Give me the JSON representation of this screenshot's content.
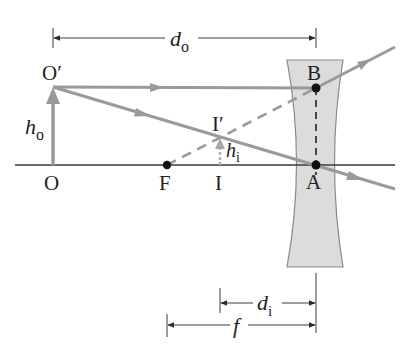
{
  "diagram": {
    "type": "ray-diagram-diverging-lens",
    "colors": {
      "ray": "#9a9a9a",
      "axis": "#3a3a3a",
      "lens_fill": "#dcdcdc",
      "lens_stroke": "#8a8a8a",
      "point": "#111111",
      "dimension": "#3a3a3a",
      "text": "#231f20"
    },
    "points": {
      "object_base": {
        "label": "O",
        "x": 53,
        "y": 165
      },
      "object_tip": {
        "label": "O′",
        "x": 53,
        "y": 87
      },
      "focal_point": {
        "label": "F",
        "x": 167,
        "y": 165
      },
      "image_base": {
        "label": "I",
        "x": 220,
        "y": 165
      },
      "image_tip": {
        "label": "I′",
        "x": 220,
        "y": 138
      },
      "lens_top_point": {
        "label": "B",
        "x": 316,
        "y": 88
      },
      "lens_center": {
        "label": "A",
        "x": 316,
        "y": 165
      }
    },
    "dimensions": {
      "object_distance": {
        "label_main": "d",
        "label_sub": "o"
      },
      "image_distance": {
        "label_main": "d",
        "label_sub": "i"
      },
      "focal_length": {
        "label_main": "f"
      },
      "object_height": {
        "label_main": "h",
        "label_sub": "o"
      },
      "image_height": {
        "label_main": "h",
        "label_sub": "i"
      }
    }
  }
}
